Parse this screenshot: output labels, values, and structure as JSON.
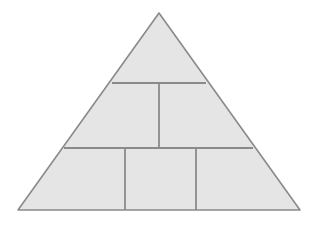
{
  "figure": {
    "name": "pyramid-block-diagram",
    "title": "",
    "caption": "",
    "background_color": "#ffffff",
    "width": 319,
    "height": 225
  },
  "style": {
    "fill_color": "#e5e5e5",
    "outline_color": "#8a8a8a",
    "divider_color": "#8a8a8a",
    "outline_width": 1.6,
    "divider_width": 1.8
  },
  "shape": {
    "type": "triangle",
    "apex": {
      "x": 159,
      "y": 13
    },
    "bottom_left": {
      "x": 18,
      "y": 210
    },
    "bottom_right": {
      "x": 300,
      "y": 210
    }
  },
  "dividers": {
    "horizontal": [
      {
        "name": "upper-horizontal-divider",
        "y": 83,
        "x1": 112,
        "x2": 206
      },
      {
        "name": "lower-horizontal-divider",
        "y": 148,
        "x1": 64,
        "x2": 253
      }
    ],
    "vertical": [
      {
        "name": "middle-band-vertical-divider",
        "x": 159,
        "y1": 83,
        "y2": 148
      },
      {
        "name": "bottom-row-left-vertical-divider",
        "x": 125,
        "y1": 148,
        "y2": 210
      },
      {
        "name": "bottom-row-right-vertical-divider",
        "x": 196,
        "y1": 148,
        "y2": 210
      }
    ]
  },
  "blocks": [
    {
      "id": "apex-block",
      "label": "",
      "row": 1,
      "position": 1
    },
    {
      "id": "middle-left-block",
      "label": "",
      "row": 2,
      "position": 1
    },
    {
      "id": "middle-right-block",
      "label": "",
      "row": 2,
      "position": 2
    },
    {
      "id": "bottom-left-block",
      "label": "",
      "row": 3,
      "position": 1
    },
    {
      "id": "bottom-center-block",
      "label": "",
      "row": 3,
      "position": 2
    },
    {
      "id": "bottom-right-block",
      "label": "",
      "row": 3,
      "position": 3
    }
  ],
  "counts": {
    "rows": 3,
    "blocks_total": 6
  }
}
